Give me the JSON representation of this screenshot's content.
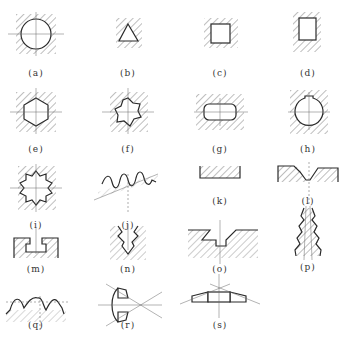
{
  "figure": {
    "panels": [
      {
        "id": "a",
        "label": "(a)",
        "shape": "circular-hole"
      },
      {
        "id": "b",
        "label": "(b)",
        "shape": "triangular-hole"
      },
      {
        "id": "c",
        "label": "(c)",
        "shape": "square-hole"
      },
      {
        "id": "d",
        "label": "(d)",
        "shape": "rectangular-hole"
      },
      {
        "id": "e",
        "label": "(e)",
        "shape": "hexagonal-hole"
      },
      {
        "id": "f",
        "label": "(f)",
        "shape": "multi-notch-hole"
      },
      {
        "id": "g",
        "label": "(g)",
        "shape": "oblong-hole"
      },
      {
        "id": "h",
        "label": "(h)",
        "shape": "keyed-circular-hole"
      },
      {
        "id": "i",
        "label": "(i)",
        "shape": "internal-spline"
      },
      {
        "id": "j",
        "label": "(j)",
        "shape": "gear-rack-profile"
      },
      {
        "id": "k",
        "label": "(k)",
        "shape": "flat-surface"
      },
      {
        "id": "l",
        "label": "(l)",
        "shape": "v-groove-profile"
      },
      {
        "id": "m",
        "label": "(m)",
        "shape": "t-slot"
      },
      {
        "id": "n",
        "label": "(n)",
        "shape": "serrated-v-groove"
      },
      {
        "id": "o",
        "label": "(o)",
        "shape": "dovetail-groove"
      },
      {
        "id": "p",
        "label": "(p)",
        "shape": "tapered-thread"
      },
      {
        "id": "q",
        "label": "(q)",
        "shape": "tooth-form-profile"
      },
      {
        "id": "r",
        "label": "(r)",
        "shape": "bevel-gear-section"
      },
      {
        "id": "s",
        "label": "(s)",
        "shape": "bevel-ring-section"
      }
    ]
  }
}
